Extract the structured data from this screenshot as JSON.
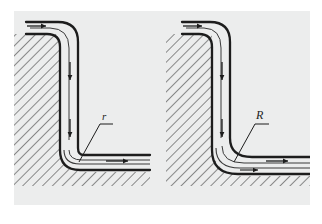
{
  "figure": {
    "background_color": "#ffffff",
    "panel_color": "#eceded",
    "ink_color": "#1d1d1d",
    "panel": {
      "x": 14,
      "y": 11,
      "width": 296,
      "height": 194
    }
  },
  "diagrams": [
    {
      "id": "small-radius-bend",
      "label": "r",
      "label_meaning": "small bend radius",
      "label_position": {
        "x": 103,
        "y": 119
      },
      "leader_from": {
        "x": 98,
        "y": 123
      },
      "leader_to": {
        "x": 78,
        "y": 163
      },
      "inlet_direction": "right",
      "outlet_direction": "right",
      "flow_arrows": [
        {
          "name": "inlet-arrow",
          "x": 40,
          "y": 26,
          "dir": "right"
        },
        {
          "name": "vertical-arrow-upper",
          "x": 70,
          "y": 71,
          "dir": "down"
        },
        {
          "name": "vertical-arrow-lower",
          "x": 70,
          "y": 128,
          "dir": "down"
        },
        {
          "name": "outlet-arrow",
          "x": 120,
          "y": 161,
          "dir": "right"
        }
      ]
    },
    {
      "id": "large-radius-bend",
      "label": "R",
      "label_meaning": "large bend radius",
      "label_position": {
        "x": 258,
        "y": 118
      },
      "leader_from": {
        "x": 254,
        "y": 123
      },
      "leader_to": {
        "x": 235,
        "y": 163
      },
      "inlet_direction": "right",
      "outlet_direction": "right",
      "flow_arrows": [
        {
          "name": "inlet-arrow",
          "x": 196,
          "y": 26,
          "dir": "right"
        },
        {
          "name": "vertical-arrow-upper",
          "x": 222,
          "y": 71,
          "dir": "down"
        },
        {
          "name": "vertical-arrow-lower",
          "x": 222,
          "y": 128,
          "dir": "down"
        },
        {
          "name": "outlet-arrow",
          "x": 278,
          "y": 160,
          "dir": "right"
        }
      ]
    }
  ]
}
